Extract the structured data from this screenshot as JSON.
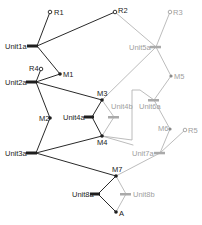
{
  "colors": {
    "active": "#1e1e1e",
    "inactive": "#a8a8a8",
    "background": "#ffffff"
  },
  "nodes": {
    "R1": {
      "label": "R1",
      "x": 50,
      "y": 12,
      "type": "resource",
      "state": "active"
    },
    "R2": {
      "label": "R2",
      "x": 115,
      "y": 12,
      "type": "resource",
      "state": "active"
    },
    "R3": {
      "label": "R3",
      "x": 170,
      "y": 12,
      "type": "resource",
      "state": "inactive"
    },
    "R4": {
      "label": "R4",
      "x": 41,
      "y": 69,
      "type": "resource",
      "state": "active"
    },
    "R5": {
      "label": "R5",
      "x": 185,
      "y": 130,
      "type": "resource",
      "state": "inactive"
    },
    "M1": {
      "label": "M1",
      "x": 60,
      "y": 74,
      "type": "milestone",
      "state": "active"
    },
    "M2": {
      "label": "M2",
      "x": 50,
      "y": 118,
      "type": "milestone",
      "state": "active"
    },
    "M3": {
      "label": "M3",
      "x": 102,
      "y": 100,
      "type": "milestone",
      "state": "active"
    },
    "M4": {
      "label": "M4",
      "x": 102,
      "y": 136,
      "type": "milestone",
      "state": "active"
    },
    "M5": {
      "label": "M5",
      "x": 171,
      "y": 76,
      "type": "milestone",
      "state": "inactive"
    },
    "M6": {
      "label": "M6",
      "x": 170,
      "y": 129,
      "type": "milestone",
      "state": "inactive"
    },
    "M7": {
      "label": "M7",
      "x": 116,
      "y": 176,
      "type": "milestone",
      "state": "active"
    },
    "A": {
      "label": "A",
      "x": 116,
      "y": 212,
      "type": "milestone",
      "state": "active"
    },
    "Unit1a": {
      "label": "Unit1a",
      "x": 33,
      "y": 46,
      "type": "unit",
      "state": "active"
    },
    "Unit2a": {
      "label": "Unit2a",
      "x": 33,
      "y": 82,
      "type": "unit",
      "state": "active"
    },
    "Unit3a": {
      "label": "Unit3a",
      "x": 33,
      "y": 153,
      "type": "unit",
      "state": "active"
    },
    "Unit4a": {
      "label": "Unit4a",
      "x": 89,
      "y": 117,
      "type": "unit",
      "state": "active"
    },
    "Unit4b": {
      "label": "Unit4b",
      "x": 114,
      "y": 117,
      "type": "unit",
      "state": "inactive"
    },
    "Unit5a": {
      "label": "Unit5a",
      "x": 156,
      "y": 47,
      "type": "unit",
      "state": "inactive"
    },
    "Unit6a": {
      "label": "Unit6a",
      "x": 154,
      "y": 100,
      "type": "unit",
      "state": "inactive"
    },
    "Unit7a": {
      "label": "Unit7a",
      "x": 160,
      "y": 153,
      "type": "unit",
      "state": "inactive"
    },
    "Unit8a": {
      "label": "Unit8a",
      "x": 98,
      "y": 194,
      "type": "unit",
      "state": "active"
    },
    "Unit8b": {
      "label": "Unit8b",
      "x": 126,
      "y": 194,
      "type": "unit",
      "state": "inactive"
    }
  },
  "edges": [
    {
      "from": "Unit1a",
      "to": "R1",
      "state": "active"
    },
    {
      "from": "Unit1a",
      "to": "R2",
      "state": "active"
    },
    {
      "from": "Unit1a",
      "to": "M1",
      "state": "active"
    },
    {
      "from": "M1",
      "to": "Unit2a",
      "state": "active"
    },
    {
      "from": "Unit2a",
      "to": "R4",
      "state": "active"
    },
    {
      "from": "Unit2a",
      "to": "M3",
      "state": "active"
    },
    {
      "from": "Unit2a",
      "to": "M2",
      "state": "active"
    },
    {
      "from": "M2",
      "to": "Unit3a",
      "state": "active"
    },
    {
      "from": "Unit3a",
      "to": "M3",
      "state": "active"
    },
    {
      "from": "Unit3a",
      "to": "M4",
      "state": "active"
    },
    {
      "from": "M3",
      "to": "Unit4a",
      "state": "active"
    },
    {
      "from": "Unit4a",
      "to": "M4",
      "state": "active"
    },
    {
      "from": "M3",
      "to": "Unit4b",
      "state": "inactive"
    },
    {
      "from": "Unit4b",
      "to": "M4",
      "state": "inactive"
    },
    {
      "from": "R2",
      "to": "Unit5a",
      "state": "inactive"
    },
    {
      "from": "Unit5a",
      "to": "R3",
      "state": "inactive"
    },
    {
      "from": "Unit5a",
      "to": "M3",
      "state": "inactive"
    },
    {
      "from": "Unit5a",
      "to": "M5",
      "state": "inactive"
    },
    {
      "from": "M5",
      "to": "Unit6a",
      "state": "inactive"
    },
    {
      "from": "Unit6a",
      "to": "M6",
      "state": "inactive"
    },
    {
      "from": "Unit6a",
      "to": "M4",
      "state": "inactive",
      "routed": true
    },
    {
      "from": "M6",
      "to": "Unit7a",
      "state": "inactive"
    },
    {
      "from": "Unit7a",
      "to": "R5",
      "state": "inactive"
    },
    {
      "from": "Unit7a",
      "to": "M7",
      "state": "inactive"
    },
    {
      "from": "M4",
      "to": "Unit7a",
      "state": "inactive"
    },
    {
      "from": "Unit3a",
      "to": "M7",
      "state": "active"
    },
    {
      "from": "M7",
      "to": "Unit8a",
      "state": "active"
    },
    {
      "from": "Unit8a",
      "to": "A",
      "state": "active"
    },
    {
      "from": "M7",
      "to": "Unit8b",
      "state": "inactive"
    },
    {
      "from": "Unit8b",
      "to": "A",
      "state": "inactive"
    }
  ]
}
